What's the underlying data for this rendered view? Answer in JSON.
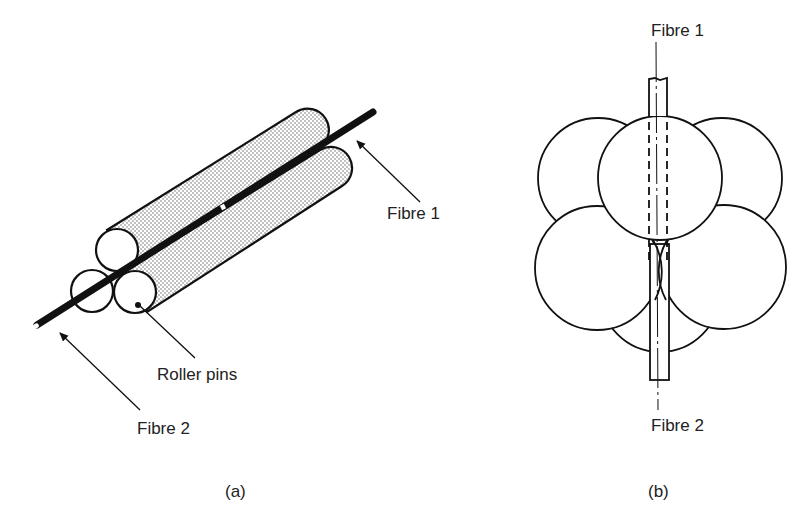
{
  "figure": {
    "panel_a": {
      "caption": "(a)",
      "labels": {
        "fibre1": "Fibre 1",
        "fibre2": "Fibre 2",
        "roller_pins": "Roller pins"
      }
    },
    "panel_b": {
      "caption": "(b)",
      "labels": {
        "fibre1": "Fibre 1",
        "fibre2": "Fibre 2"
      }
    }
  },
  "colors": {
    "ink": "#111111",
    "text": "#222222",
    "background": "#ffffff"
  }
}
